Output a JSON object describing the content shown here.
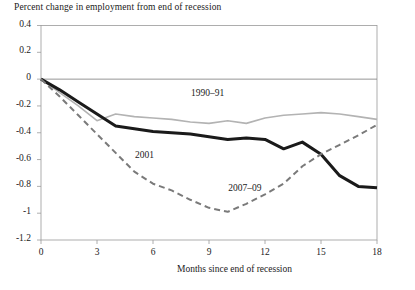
{
  "chart_data": {
    "type": "line",
    "title": "Percent change in employment from end of recession",
    "xlabel": "Months since end of recession",
    "ylabel": "",
    "xlim": [
      0,
      18
    ],
    "ylim": [
      -1.2,
      0.4
    ],
    "xticks": [
      "0",
      "3",
      "6",
      "9",
      "12",
      "15",
      "18"
    ],
    "yticks": [
      "0.4",
      "0.2",
      "0",
      "-0.2",
      "-0.4",
      "-0.6",
      "-0.8",
      "-1",
      "-1.2"
    ],
    "grid": false,
    "zero_line": true,
    "legend_position": "inline-annotations",
    "x": [
      0,
      1,
      2,
      3,
      4,
      5,
      6,
      7,
      8,
      9,
      10,
      11,
      12,
      13,
      14,
      15,
      16,
      17,
      18
    ],
    "series": [
      {
        "name": "1990–91",
        "style": "solid",
        "color": "#b3b3b3",
        "width": 1.6,
        "label_x": 9.0,
        "label_y": -0.12,
        "values": [
          0.0,
          -0.1,
          -0.2,
          -0.31,
          -0.26,
          -0.28,
          -0.29,
          -0.3,
          -0.32,
          -0.33,
          -0.31,
          -0.33,
          -0.29,
          -0.27,
          -0.26,
          -0.25,
          -0.26,
          -0.28,
          -0.3
        ]
      },
      {
        "name": "2001",
        "style": "solid",
        "color": "#1a1a1a",
        "width": 3.0,
        "label_x": 6.0,
        "label_y": -0.58,
        "values": [
          0.0,
          -0.08,
          -0.17,
          -0.26,
          -0.35,
          -0.37,
          -0.39,
          -0.4,
          -0.41,
          -0.43,
          -0.45,
          -0.44,
          -0.45,
          -0.52,
          -0.47,
          -0.56,
          -0.72,
          -0.8,
          -0.81
        ]
      },
      {
        "name": "2007–09",
        "style": "dashed",
        "color": "#7a7a7a",
        "width": 2.0,
        "label_x": 11.0,
        "label_y": -0.83,
        "values": [
          0.0,
          -0.13,
          -0.27,
          -0.41,
          -0.55,
          -0.69,
          -0.78,
          -0.83,
          -0.9,
          -0.96,
          -0.99,
          -0.93,
          -0.86,
          -0.78,
          -0.65,
          -0.56,
          -0.49,
          -0.42,
          -0.34
        ]
      }
    ],
    "series_overrides": {
      "1990-91": {
        "note": "gray solid, dips to about -0.33 near month 3 then flattens near -0.27, rises through zero around month 13 ending near +0.31"
      },
      "2007-09": {
        "note": "dashed, trough near -0.99 at month 8, recovering to about -0.19 at month 18"
      }
    }
  }
}
